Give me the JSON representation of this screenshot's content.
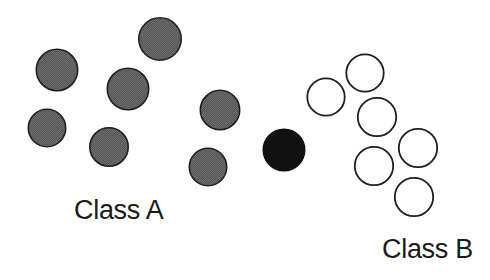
{
  "figure": {
    "width": 490,
    "height": 280,
    "background": "#ffffff"
  },
  "labels": {
    "class_a": "Class A",
    "class_b": "Class B"
  },
  "style": {
    "filled_gray_color": "#585858",
    "filled_black_color": "#111111",
    "open_stroke_color": "#1f1f1f",
    "open_fill_color": "#ffffff",
    "outline_width": 1.6,
    "text_color": "#1a1a1a"
  },
  "chart_data": {
    "type": "scatter",
    "title": "",
    "xlabel": "",
    "ylabel": "",
    "xlim": [
      0,
      490
    ],
    "ylim": [
      0,
      280
    ],
    "grid": false,
    "axes_visible": false,
    "legend_position": "in-plot-annotations",
    "annotations": [
      {
        "text": "Class A",
        "x": 74,
        "y": 210,
        "anchor": "left"
      },
      {
        "text": "Class B",
        "x": 382,
        "y": 249,
        "anchor": "left"
      }
    ],
    "series": [
      {
        "name": "Class A",
        "marker": "filled-gray-circle",
        "color": "#585858",
        "edge_color": "#1f1f1f",
        "points": [
          {
            "x": 160,
            "y": 39,
            "d": 44
          },
          {
            "x": 57,
            "y": 70,
            "d": 43
          },
          {
            "x": 128,
            "y": 89,
            "d": 43
          },
          {
            "x": 220,
            "y": 110,
            "d": 41
          },
          {
            "x": 47,
            "y": 128,
            "d": 39
          },
          {
            "x": 109,
            "y": 147,
            "d": 40
          },
          {
            "x": 208,
            "y": 167,
            "d": 39
          }
        ]
      },
      {
        "name": "Query point",
        "marker": "filled-black-circle",
        "color": "#111111",
        "edge_color": "#111111",
        "points": [
          {
            "x": 284,
            "y": 150,
            "d": 43
          }
        ]
      },
      {
        "name": "Class B",
        "marker": "open-circle",
        "color": "#ffffff",
        "edge_color": "#1f1f1f",
        "points": [
          {
            "x": 365,
            "y": 73,
            "d": 39
          },
          {
            "x": 326,
            "y": 97,
            "d": 39
          },
          {
            "x": 377,
            "y": 117,
            "d": 40
          },
          {
            "x": 418,
            "y": 148,
            "d": 40
          },
          {
            "x": 374,
            "y": 166,
            "d": 40
          },
          {
            "x": 414,
            "y": 197,
            "d": 40
          }
        ]
      }
    ]
  }
}
